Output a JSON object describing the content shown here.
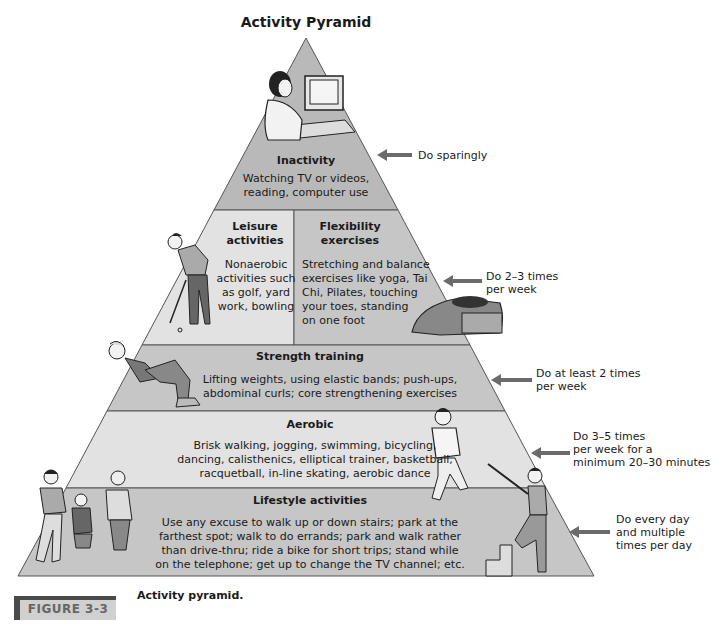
{
  "title": "Activity Pyramid",
  "colors": {
    "top_band": "#b9b9b9",
    "light_band": "#e2e2e2",
    "mid_band": "#c6c6c6",
    "arrow": "#6b6b6b"
  },
  "bands": {
    "inactivity": {
      "title": "Inactivity",
      "text": [
        "Watching TV or videos,",
        "reading, computer use"
      ],
      "recommendation": "Do sparingly",
      "illustration": "person-at-computer"
    },
    "leisure": {
      "title": [
        "Leisure",
        "activities"
      ],
      "text": [
        "Nonaerobic",
        "activities such",
        "as golf, yard",
        "work, bowling"
      ],
      "illustration": "golfer"
    },
    "flexibility": {
      "title": [
        "Flexibility",
        "exercises"
      ],
      "text": [
        "Stretching and balance",
        "exercises like yoga, Tai",
        "Chi, Pilates, touching",
        "your toes, standing",
        "on one foot"
      ],
      "recommendation": [
        "Do 2–3 times",
        "per week"
      ],
      "illustration": "person-stretching"
    },
    "strength": {
      "title": "Strength training",
      "text": [
        "Lifting weights, using elastic bands; push-ups,",
        "abdominal curls; core strengthening exercises"
      ],
      "recommendation": [
        "Do at least 2 times",
        "per week"
      ],
      "illustration": "person-doing-crunches"
    },
    "aerobic": {
      "title": "Aerobic",
      "text": [
        "Brisk walking, jogging, swimming, bicycling,",
        "dancing, calisthenics, elliptical trainer, basketball,",
        "racquetball, in-line skating, aerobic dance"
      ],
      "recommendation": [
        "Do 3–5 times",
        "per week for a",
        "minimum 20–30 minutes"
      ],
      "illustration": "jogger"
    },
    "lifestyle": {
      "title": "Lifestyle activities",
      "text": [
        "Use any excuse to walk up or down stairs; park at the",
        "farthest spot; walk to do errands; park and walk rather",
        "than drive-thru; ride a bike for short trips; stand while",
        "on the telephone; get up to change the TV channel; etc."
      ],
      "recommendation": [
        "Do every day",
        "and multiple",
        "times per day"
      ],
      "illustration": [
        "family-walking",
        "person-climbing-stairs"
      ]
    }
  },
  "figure": {
    "tab": "FIGURE 3-3",
    "caption": "Activity pyramid."
  }
}
